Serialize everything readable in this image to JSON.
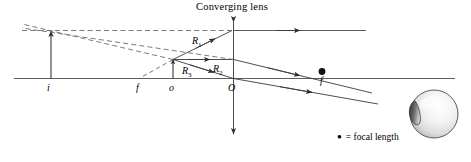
{
  "figure": {
    "title": "Converging lens",
    "width": 471,
    "height": 162,
    "background": "#ffffff",
    "line_color": "#3a3a3a",
    "dash_color": "#6b6b6b",
    "text_color": "#000000"
  },
  "labels": {
    "image_point": "i",
    "focal_left": "f",
    "object_point": "o",
    "lens_center": "O",
    "focal_right": "f"
  },
  "rays": {
    "ray1": "R",
    "ray1_sub": "1",
    "ray2": "R",
    "ray2_sub": "2",
    "ray3": "R",
    "ray3_sub": "3"
  },
  "legend": {
    "marker": "●",
    "text": "= focal length"
  },
  "eye": {
    "name": "observer-eye"
  }
}
